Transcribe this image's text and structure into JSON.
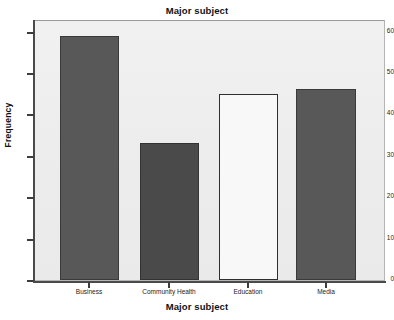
{
  "chart_data": {
    "type": "bar",
    "title": "Major subject",
    "xlabel": "Major subject",
    "ylabel": "Frequency",
    "categories": [
      "Business",
      "Community Health",
      "Education",
      "Media"
    ],
    "values": [
      59,
      33,
      45,
      46
    ],
    "series": [
      {
        "name": "Frequency",
        "values": [
          59,
          33,
          45,
          46
        ]
      }
    ],
    "ylim": [
      0,
      63
    ],
    "yticks": [
      0,
      10,
      20,
      30,
      40,
      50,
      60
    ],
    "ytick_labels": [
      "0",
      "10",
      "20",
      "30",
      "40",
      "50",
      "60"
    ],
    "grid": false,
    "legend": "none",
    "bar_colors": [
      "#585858",
      "#4a4a4a",
      "#f8f8f8",
      "#585858"
    ],
    "plot_background": "#eeeeee",
    "figure_background": "#ffffff",
    "axis_color": "#4a4a4a"
  }
}
